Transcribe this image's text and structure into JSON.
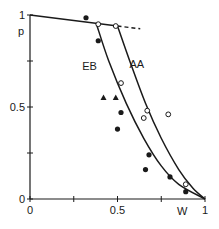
{
  "chart_data": {
    "type": "scatter",
    "title": "",
    "xlabel": "W",
    "ylabel": "p",
    "xlim": [
      0,
      1
    ],
    "ylim": [
      0,
      1
    ],
    "x_ticks": [
      0,
      0.25,
      0.5,
      0.75,
      1
    ],
    "x_tick_labels": [
      "0",
      "",
      "0.5",
      "",
      "1"
    ],
    "y_ticks": [
      0,
      0.25,
      0.5,
      0.75,
      1
    ],
    "y_tick_labels": [
      "0",
      "",
      "0.5",
      "",
      "1"
    ],
    "grid": false,
    "curve_labels": [
      {
        "text": "EB",
        "x": 0.34,
        "y": 0.7
      },
      {
        "text": "AA",
        "x": 0.61,
        "y": 0.71
      }
    ],
    "series": [
      {
        "name": "top line",
        "kind": "line",
        "points": [
          [
            0,
            1.0
          ],
          [
            0.5,
            0.94
          ]
        ],
        "dashed_extension": [
          [
            0.5,
            0.94
          ],
          [
            0.63,
            0.925
          ]
        ]
      },
      {
        "name": "EB",
        "kind": "curve",
        "points": [
          [
            0.38,
            0.95
          ],
          [
            0.45,
            0.75
          ],
          [
            0.55,
            0.52
          ],
          [
            0.65,
            0.33
          ],
          [
            0.75,
            0.18
          ],
          [
            0.85,
            0.08
          ],
          [
            1.0,
            0.0
          ]
        ]
      },
      {
        "name": "AA",
        "kind": "curve",
        "points": [
          [
            0.5,
            0.94
          ],
          [
            0.57,
            0.75
          ],
          [
            0.66,
            0.52
          ],
          [
            0.75,
            0.33
          ],
          [
            0.85,
            0.16
          ],
          [
            0.93,
            0.06
          ],
          [
            1.0,
            0.0
          ]
        ]
      },
      {
        "name": "filled circles",
        "kind": "scatter",
        "marker": "filled-circle",
        "points": [
          [
            0.32,
            0.985
          ],
          [
            0.39,
            0.86
          ],
          [
            0.52,
            0.47
          ],
          [
            0.5,
            0.38
          ],
          [
            0.68,
            0.24
          ],
          [
            0.66,
            0.16
          ],
          [
            0.8,
            0.12
          ],
          [
            0.89,
            0.04
          ]
        ]
      },
      {
        "name": "open circles",
        "kind": "scatter",
        "marker": "open-circle",
        "points": [
          [
            0.39,
            0.95
          ],
          [
            0.49,
            0.94
          ],
          [
            0.52,
            0.63
          ],
          [
            0.67,
            0.48
          ],
          [
            0.65,
            0.44
          ],
          [
            0.79,
            0.46
          ],
          [
            0.89,
            0.08
          ]
        ]
      },
      {
        "name": "triangles",
        "kind": "scatter",
        "marker": "filled-triangle",
        "points": [
          [
            0.42,
            0.55
          ],
          [
            0.49,
            0.55
          ]
        ]
      }
    ],
    "colors": {
      "ink": "#1a1a1a",
      "background": "#ffffff"
    }
  }
}
